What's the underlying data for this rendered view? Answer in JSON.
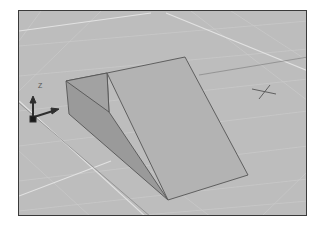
{
  "viewport": {
    "background_color": "#bdbdbd",
    "border_color": "#3a3a3a",
    "grid_color": "#d4d4d4",
    "major_grid_color": "#e6e6e6"
  },
  "model": {
    "type": "wedge-solid",
    "face_colors": {
      "top_slope": "#b0b0b0",
      "side": "#9a9a9a",
      "back": "#a4a4a4"
    },
    "edge_color": "#555555"
  },
  "ucs_icon": {
    "z_label": "Z",
    "y_label": "Y",
    "x_label": "X"
  },
  "cursor": {
    "type": "crosshair"
  }
}
